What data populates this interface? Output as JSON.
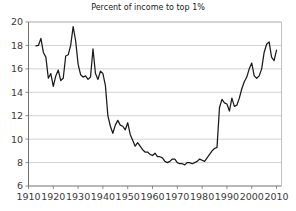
{
  "chart_data": {
    "type": "line",
    "title": "Percent of income to top 1%",
    "xlabel": "",
    "ylabel": "",
    "xlim": [
      1910,
      2012
    ],
    "ylim": [
      6,
      20
    ],
    "xticks": [
      1910,
      1920,
      1930,
      1940,
      1950,
      1960,
      1970,
      1980,
      1990,
      2000,
      2010
    ],
    "yticks": [
      6,
      8,
      10,
      12,
      14,
      16,
      18,
      20
    ],
    "grid": "horizontal",
    "legend": "none",
    "line_color": "#1a1a1a",
    "axis_color": "#808080",
    "grid_color": "#c8c8c8",
    "background": "#ffffff",
    "series": [
      {
        "name": "Percent of income to top 1%",
        "x": [
          1913,
          1914,
          1915,
          1916,
          1917,
          1918,
          1919,
          1920,
          1921,
          1922,
          1923,
          1924,
          1925,
          1926,
          1927,
          1928,
          1929,
          1930,
          1931,
          1932,
          1933,
          1934,
          1935,
          1936,
          1937,
          1938,
          1939,
          1940,
          1941,
          1942,
          1943,
          1944,
          1945,
          1946,
          1947,
          1948,
          1949,
          1950,
          1951,
          1952,
          1953,
          1954,
          1955,
          1956,
          1957,
          1958,
          1959,
          1960,
          1961,
          1962,
          1963,
          1964,
          1965,
          1966,
          1967,
          1968,
          1969,
          1970,
          1971,
          1972,
          1973,
          1974,
          1975,
          1976,
          1977,
          1978,
          1979,
          1980,
          1981,
          1982,
          1983,
          1984,
          1985,
          1986,
          1987,
          1988,
          1989,
          1990,
          1991,
          1992,
          1993,
          1994,
          1995,
          1996,
          1997,
          1998,
          1999,
          2000,
          2001,
          2002,
          2003,
          2004,
          2005,
          2006,
          2007,
          2008,
          2009,
          2010
        ],
        "values": [
          17.96,
          18.0,
          18.6,
          17.4,
          17.0,
          15.2,
          15.6,
          14.5,
          15.4,
          15.9,
          15.0,
          15.2,
          17.1,
          17.2,
          18.0,
          19.6,
          18.4,
          16.4,
          15.5,
          15.3,
          15.4,
          15.1,
          15.3,
          17.7,
          15.6,
          15.1,
          15.8,
          15.6,
          14.6,
          12.0,
          11.1,
          10.5,
          11.2,
          11.6,
          11.2,
          11.1,
          10.8,
          11.4,
          10.4,
          9.9,
          9.4,
          9.7,
          9.4,
          9.1,
          8.9,
          8.9,
          8.7,
          8.6,
          8.8,
          8.5,
          8.5,
          8.4,
          8.1,
          8.0,
          8.1,
          8.3,
          8.3,
          8.0,
          7.9,
          7.9,
          7.8,
          8.0,
          8.0,
          7.9,
          8.0,
          8.1,
          8.3,
          8.2,
          8.1,
          8.4,
          8.7,
          9.0,
          9.2,
          9.3,
          12.7,
          13.4,
          13.1,
          13.0,
          12.4,
          13.5,
          12.8,
          12.9,
          13.5,
          14.3,
          14.9,
          15.3,
          16.0,
          16.5,
          15.4,
          15.2,
          15.4,
          16.0,
          17.4,
          18.1,
          18.3,
          17.0,
          16.7,
          17.6
        ]
      }
    ]
  }
}
